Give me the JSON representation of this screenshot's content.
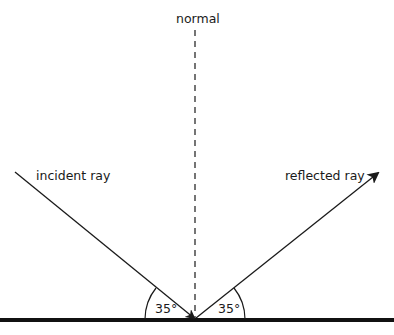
{
  "diagram": {
    "labels": {
      "normal": "normal",
      "incident": "incident ray",
      "reflected": "reflected ray",
      "angle_left": "35°",
      "angle_right": "35°"
    },
    "angle_of_incidence_deg": 35,
    "angle_of_reflection_deg": 35,
    "colors": {
      "line": "#1a1a1a",
      "background": "#ffffff"
    }
  }
}
